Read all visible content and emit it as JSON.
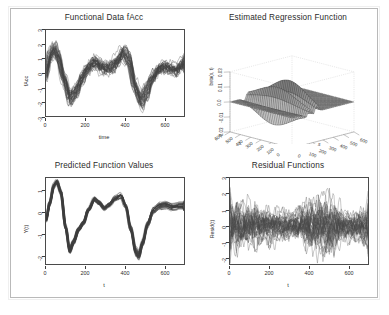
{
  "figure": {
    "background": "#ffffff",
    "frame_color": "#b9b9b9",
    "line_color": "#1a1a1a",
    "layout": "2x2 panel grid"
  },
  "panels": [
    {
      "id": "functional-data",
      "title": "Functional Data fAcc",
      "xlabel": "time",
      "ylabel": "fAcc"
    },
    {
      "id": "estimated-regression-function",
      "title": "Estimated Regression Function",
      "xlabel": "s",
      "ylabel": "t",
      "zlabel": "beta(s, t)"
    },
    {
      "id": "predicted-function-values",
      "title": "Predicted Function Values",
      "xlabel": "t",
      "ylabel": "Y(t)"
    },
    {
      "id": "residual-functions",
      "title": "Residual Functions",
      "xlabel": "t",
      "ylabel": "Resid(t)"
    }
  ],
  "chart_data": [
    {
      "type": "line",
      "id": "functional-data",
      "title": "Functional Data fAcc",
      "xlabel": "time",
      "ylabel": "fAcc",
      "xlim": [
        0,
        700
      ],
      "ylim": [
        -3,
        3
      ],
      "xticks": [
        0,
        200,
        400,
        600
      ],
      "yticks": [
        -3,
        -2,
        -1,
        0,
        1,
        2,
        3
      ],
      "grid": false,
      "legend": "none",
      "n_curves": 40,
      "description": "Dense overplotted bundle of accelerometer curves; mean shape shows a peak near time 40, trough near 120, broad plateau 200-320, peak near 400, deep trough near 470, recovery toward 650.",
      "mean_x": [
        0,
        20,
        40,
        60,
        90,
        120,
        150,
        180,
        210,
        240,
        270,
        300,
        330,
        360,
        390,
        420,
        450,
        480,
        510,
        540,
        570,
        600,
        630,
        660,
        690
      ],
      "mean_y": [
        0.0,
        1.2,
        1.6,
        1.1,
        -0.4,
        -1.7,
        -1.3,
        -0.4,
        0.3,
        0.6,
        0.5,
        0.3,
        0.4,
        0.8,
        1.4,
        0.9,
        -0.9,
        -1.9,
        -1.2,
        -0.3,
        0.2,
        0.4,
        0.3,
        0.2,
        0.6
      ],
      "spread": 0.9
    },
    {
      "type": "surface",
      "id": "estimated-regression-function",
      "title": "Estimated Regression Function",
      "xlabel": "s",
      "ylabel": "t",
      "zlabel": "beta(s, t)",
      "xticks": [
        0,
        100,
        200,
        300,
        400,
        500,
        600
      ],
      "yticks": [
        0,
        100,
        200,
        300,
        400,
        500,
        600
      ],
      "zticks": [
        "-0.03",
        "-0.01",
        "0.0",
        "0.01",
        "0.03"
      ],
      "zlim": [
        -0.03,
        0.03
      ],
      "grid": true,
      "legend": "none",
      "description": "3D perspective wireframe/mesh surface, mostly flat near zero with sharp positive ridges and a deep negative trough concentrated near the diagonal around s=150-300."
    },
    {
      "type": "line",
      "id": "predicted-function-values",
      "title": "Predicted Function Values",
      "xlabel": "t",
      "ylabel": "Y(t)",
      "xlim": [
        0,
        700
      ],
      "ylim": [
        -2.4,
        1.6
      ],
      "xticks": [
        0,
        200,
        400,
        600
      ],
      "yticks": [
        -2,
        -1,
        0,
        1
      ],
      "grid": false,
      "legend": "none",
      "n_curves": 40,
      "description": "Tight bundle of smooth predicted curves; sharp peak ~1.4 at t=55, trough ~-1.8 at t=120, rise to ~0.6 at t=250, small dip, peak ~0.8 at t=380, deep trough ~-2.0 at t=470, recovery to ~0.4 with fanning spread at the right.",
      "mean_x": [
        0,
        20,
        40,
        55,
        75,
        100,
        120,
        140,
        165,
        190,
        215,
        245,
        270,
        295,
        320,
        350,
        380,
        405,
        430,
        455,
        470,
        490,
        515,
        545,
        575,
        605,
        640,
        680
      ],
      "mean_y": [
        -0.35,
        0.45,
        1.25,
        1.42,
        0.95,
        -0.7,
        -1.75,
        -1.35,
        -0.75,
        -0.45,
        0.15,
        0.62,
        0.45,
        0.2,
        0.35,
        0.66,
        0.8,
        0.3,
        -0.75,
        -1.8,
        -2.0,
        -1.4,
        -0.55,
        0.1,
        0.3,
        0.35,
        0.25,
        0.3
      ],
      "spread": 0.22
    },
    {
      "type": "line",
      "id": "residual-functions",
      "title": "Residual Functions",
      "xlabel": "t",
      "ylabel": "Resid(t)",
      "xlim": [
        0,
        700
      ],
      "ylim": [
        -2.4,
        3.0
      ],
      "xticks": [
        0,
        200,
        400,
        600
      ],
      "yticks": [
        -2,
        -1,
        0,
        1,
        2,
        3
      ],
      "grid": false,
      "legend": "none",
      "n_curves": 40,
      "description": "High-frequency noise bundle centred on zero; amplitude widest near t=0-150 and t=400-520 where excursions reach about +2.7 and -2.2, narrowing toward t=600.",
      "mean_x": [
        0,
        100,
        200,
        300,
        400,
        500,
        600,
        700
      ],
      "mean_y": [
        0,
        0,
        0,
        0,
        0,
        0,
        0,
        0
      ],
      "envelope": [
        1.9,
        1.5,
        1.2,
        1.0,
        1.8,
        2.2,
        1.0,
        1.4
      ]
    }
  ]
}
